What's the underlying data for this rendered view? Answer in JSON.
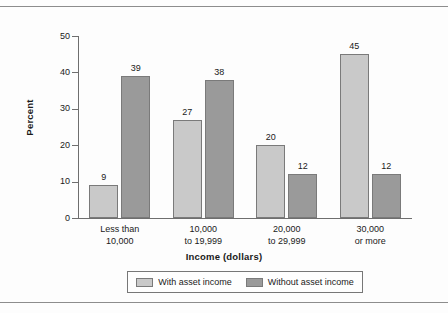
{
  "figure": {
    "ylabel": "Percent",
    "xlabel": "Income (dollars)"
  },
  "legend": {
    "entries": [
      {
        "label": "With asset income",
        "color": "#c9c9c9",
        "swatch": "legend-swatch-light"
      },
      {
        "label": "Without asset income",
        "color": "#9a9a9a",
        "swatch": "legend-swatch-dark"
      }
    ]
  },
  "yticks": [
    {
      "label": "0"
    },
    {
      "label": "10"
    },
    {
      "label": "20"
    },
    {
      "label": "30"
    },
    {
      "label": "40"
    },
    {
      "label": "50"
    }
  ],
  "categories": [
    {
      "line1": "Less than",
      "line2": "10,000"
    },
    {
      "line1": "10,000",
      "line2": "to 19,999"
    },
    {
      "line1": "20,000",
      "line2": "to 29,999"
    },
    {
      "line1": "30,000",
      "line2": "or more"
    }
  ],
  "bars": [
    {
      "value": "9",
      "series": "With asset income"
    },
    {
      "value": "39",
      "series": "Without asset income"
    },
    {
      "value": "27",
      "series": "With asset income"
    },
    {
      "value": "38",
      "series": "Without asset income"
    },
    {
      "value": "20",
      "series": "With asset income"
    },
    {
      "value": "12",
      "series": "Without asset income"
    },
    {
      "value": "45",
      "series": "With asset income"
    },
    {
      "value": "12",
      "series": "Without asset income"
    }
  ],
  "chart_data": {
    "type": "bar",
    "title": "",
    "subtitle": "",
    "xlabel": "Income (dollars)",
    "ylabel": "Percent",
    "categories": [
      "Less than 10,000",
      "10,000 to 19,999",
      "20,000 to 29,999",
      "30,000 or more"
    ],
    "series": [
      {
        "name": "With asset income",
        "values": [
          9,
          27,
          20,
          45
        ],
        "color": "#c9c9c9"
      },
      {
        "name": "Without asset income",
        "values": [
          39,
          38,
          12,
          12
        ],
        "color": "#9a9a9a"
      }
    ],
    "ylim": [
      0,
      50
    ],
    "yticks": [
      0,
      10,
      20,
      30,
      40,
      50
    ],
    "grid": false,
    "legend_position": "bottom",
    "data_labels": true,
    "units": "percent"
  }
}
